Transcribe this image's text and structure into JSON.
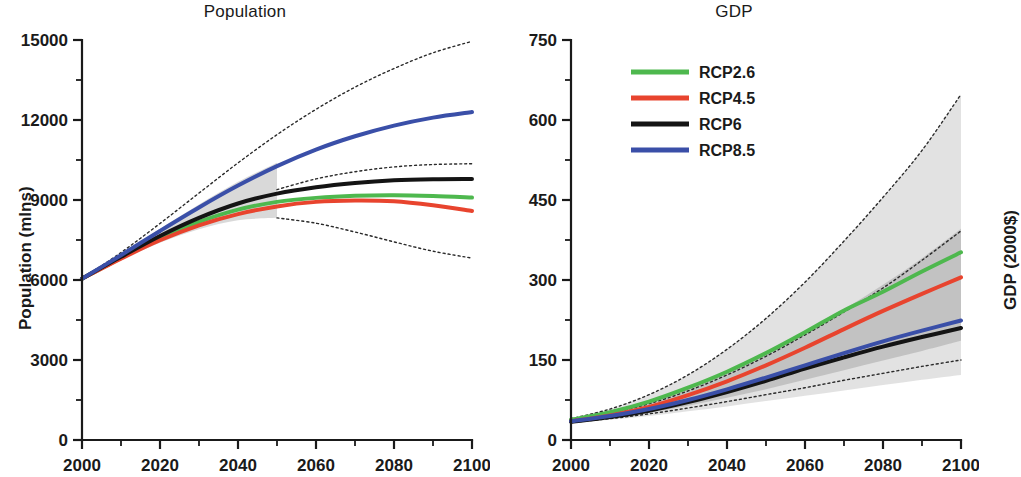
{
  "figure": {
    "panels": [
      "Population",
      "GDP"
    ]
  },
  "panel_population": {
    "title": "Population",
    "ylabel": "Population (mlns)",
    "xlabel": "",
    "yticks": [
      "0",
      "3000",
      "6000",
      "9000",
      "12000",
      "15000"
    ],
    "xticks": [
      "2000",
      "2020",
      "2040",
      "2060",
      "2080",
      "2100"
    ]
  },
  "panel_gdp": {
    "title": "GDP",
    "ylabel": "GDP (2000$)",
    "xlabel": "",
    "yticks": [
      "0",
      "150",
      "300",
      "450",
      "600",
      "750"
    ],
    "xticks": [
      "2000",
      "2020",
      "2040",
      "2060",
      "2080",
      "2100"
    ],
    "legend": [
      {
        "label": "RCP2.6",
        "color": "#4eb84e"
      },
      {
        "label": "RCP4.5",
        "color": "#e8442e"
      },
      {
        "label": "RCP6",
        "color": "#141414"
      },
      {
        "label": "RCP8.5",
        "color": "#3a4fa8"
      }
    ]
  },
  "chart_data": [
    {
      "type": "line",
      "title": "Population",
      "xlabel": "",
      "ylabel": "Population (mlns)",
      "xlim": [
        2000,
        2100
      ],
      "ylim": [
        0,
        15000
      ],
      "xticks": [
        2000,
        2020,
        2040,
        2060,
        2080,
        2100
      ],
      "yticks": [
        0,
        3000,
        6000,
        9000,
        12000,
        15000
      ],
      "minor_xticks": [
        2010,
        2030,
        2050,
        2070,
        2090
      ],
      "minor_yticks": [
        1500,
        4500,
        7500,
        10500,
        13500
      ],
      "grid": false,
      "legend": "none",
      "x": [
        2000,
        2010,
        2020,
        2030,
        2040,
        2050,
        2060,
        2070,
        2080,
        2090,
        2100
      ],
      "series": [
        {
          "name": "RCP2.6",
          "color": "#4eb84e",
          "values": [
            6050,
            6830,
            7570,
            8180,
            8640,
            8930,
            9080,
            9160,
            9180,
            9150,
            9090
          ]
        },
        {
          "name": "RCP4.5",
          "color": "#e8442e",
          "values": [
            6050,
            6800,
            7490,
            8050,
            8470,
            8760,
            8930,
            8980,
            8950,
            8800,
            8590
          ]
        },
        {
          "name": "RCP6",
          "color": "#141414",
          "values": [
            6050,
            6870,
            7650,
            8330,
            8870,
            9240,
            9480,
            9640,
            9740,
            9780,
            9790
          ]
        },
        {
          "name": "RCP8.5",
          "color": "#3a4fa8",
          "values": [
            6050,
            6930,
            7840,
            8720,
            9540,
            10270,
            10890,
            11390,
            11790,
            12090,
            12300
          ]
        }
      ],
      "envelopes": [
        {
          "name": "upper-dotted",
          "style": "dotted",
          "x": [
            2000,
            2010,
            2020,
            2030,
            2040,
            2050,
            2060,
            2070,
            2080,
            2090,
            2100
          ],
          "values": [
            6050,
            7030,
            8120,
            9260,
            10390,
            11450,
            12400,
            13230,
            13930,
            14520,
            14950
          ]
        },
        {
          "name": "mid-upper-dotted",
          "style": "dotted",
          "x": [
            2050,
            2060,
            2070,
            2080,
            2090,
            2100
          ],
          "values": [
            9390,
            9790,
            10060,
            10240,
            10330,
            10360
          ]
        },
        {
          "name": "lower-dotted",
          "style": "dotted",
          "x": [
            2050,
            2060,
            2070,
            2080,
            2090,
            2100
          ],
          "values": [
            8330,
            8130,
            7800,
            7430,
            7080,
            6820
          ]
        }
      ],
      "bands": [
        {
          "name": "historical-spread-band",
          "color": "#b9b9b9",
          "opacity": 0.55,
          "x": [
            2000,
            2010,
            2020,
            2030,
            2040,
            2050
          ],
          "lower": [
            6050,
            6760,
            7400,
            7900,
            8240,
            8330
          ],
          "upper": [
            6050,
            6960,
            7920,
            8830,
            9680,
            10400
          ]
        }
      ]
    },
    {
      "type": "line",
      "title": "GDP",
      "xlabel": "",
      "ylabel": "GDP (2000$)",
      "xlim": [
        2000,
        2100
      ],
      "ylim": [
        0,
        750
      ],
      "xticks": [
        2000,
        2020,
        2040,
        2060,
        2080,
        2100
      ],
      "yticks": [
        0,
        150,
        300,
        450,
        600,
        750
      ],
      "minor_xticks": [
        2010,
        2030,
        2050,
        2070,
        2090
      ],
      "minor_yticks": [
        75,
        225,
        375,
        525,
        675
      ],
      "grid": false,
      "legend": "upper-left",
      "x": [
        2000,
        2010,
        2020,
        2030,
        2040,
        2050,
        2060,
        2070,
        2080,
        2090,
        2100
      ],
      "series": [
        {
          "name": "RCP2.6",
          "color": "#4eb84e",
          "values": [
            38,
            52,
            72,
            98,
            128,
            163,
            202,
            243,
            278,
            316,
            352
          ]
        },
        {
          "name": "RCP4.5",
          "color": "#e8442e",
          "values": [
            35,
            46,
            62,
            84,
            110,
            140,
            173,
            208,
            242,
            274,
            305
          ]
        },
        {
          "name": "RCP6",
          "color": "#141414",
          "values": [
            34,
            43,
            55,
            71,
            90,
            111,
            134,
            155,
            175,
            193,
            210
          ]
        },
        {
          "name": "RCP8.5",
          "color": "#3a4fa8",
          "values": [
            35,
            45,
            58,
            75,
            95,
            117,
            140,
            163,
            185,
            205,
            224
          ]
        }
      ],
      "envelopes": [
        {
          "name": "upper-dotted",
          "style": "dotted",
          "x": [
            2000,
            2010,
            2020,
            2030,
            2040,
            2050,
            2060,
            2070,
            2080,
            2090,
            2100
          ],
          "values": [
            40,
            58,
            85,
            122,
            170,
            228,
            296,
            373,
            455,
            543,
            648
          ]
        },
        {
          "name": "mid-dotted",
          "style": "dotted",
          "x": [
            2000,
            2010,
            2020,
            2030,
            2040,
            2050,
            2060,
            2070,
            2080,
            2090,
            2100
          ],
          "values": [
            37,
            50,
            68,
            92,
            122,
            157,
            197,
            240,
            285,
            337,
            392
          ]
        },
        {
          "name": "lower-dotted",
          "style": "dotted",
          "x": [
            2000,
            2010,
            2020,
            2030,
            2040,
            2050,
            2060,
            2070,
            2080,
            2090,
            2100
          ],
          "values": [
            33,
            40,
            49,
            60,
            72,
            85,
            98,
            112,
            125,
            138,
            150
          ]
        }
      ],
      "bands": [
        {
          "name": "outer-spread-band",
          "color": "#d8d8d8",
          "opacity": 0.75,
          "x": [
            2000,
            2010,
            2020,
            2030,
            2040,
            2050,
            2060,
            2070,
            2080,
            2090,
            2100
          ],
          "lower": [
            32,
            38,
            45,
            54,
            63,
            73,
            83,
            93,
            103,
            113,
            122
          ],
          "upper": [
            40,
            58,
            85,
            122,
            170,
            228,
            296,
            373,
            455,
            543,
            648
          ]
        },
        {
          "name": "inner-spread-band",
          "color": "#a8a8a8",
          "opacity": 0.55,
          "x": [
            2000,
            2010,
            2020,
            2030,
            2040,
            2050,
            2060,
            2070,
            2080,
            2090,
            2100
          ],
          "lower": [
            33,
            41,
            51,
            64,
            79,
            95,
            113,
            131,
            149,
            167,
            186
          ],
          "upper": [
            38,
            52,
            71,
            96,
            126,
            161,
            201,
            245,
            291,
            341,
            396
          ]
        }
      ]
    }
  ]
}
